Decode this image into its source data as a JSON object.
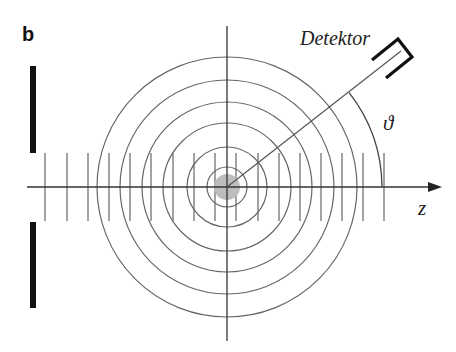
{
  "figure": {
    "panel_label": "b",
    "detector_label": "Detektor",
    "angle_label": "ϑ",
    "axis_label": "z"
  },
  "geometry": {
    "center": [
      227,
      187
    ],
    "wavefront_radii": [
      20,
      40,
      64,
      85,
      107,
      130
    ],
    "scatterer_radius": 13,
    "plane_wave_ticks_x": [
      45,
      67,
      88,
      109,
      130,
      151,
      173,
      194,
      215,
      236,
      258,
      279,
      300,
      321,
      342,
      363,
      384
    ],
    "tick_y_range": [
      153,
      221
    ],
    "detector_angle_deg": 38,
    "theta_arc_radius": 155
  },
  "colors": {
    "line": "#555555",
    "axis": "#333333",
    "scatterer": "#bdbdbd",
    "slit": "#111111"
  }
}
